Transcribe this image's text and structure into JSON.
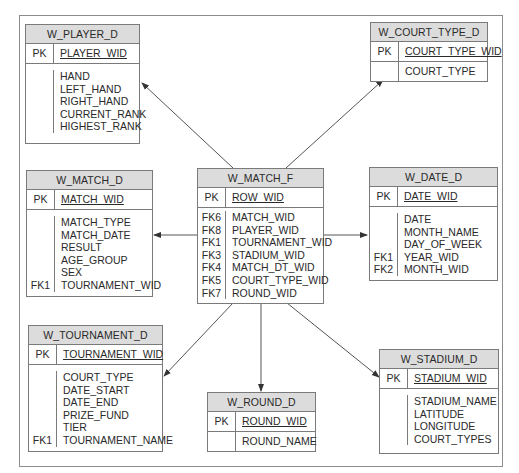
{
  "diagram": {
    "type": "star-schema",
    "fact_table": "W_MATCH_F",
    "tables": {
      "player_d": {
        "name": "W_PLAYER_D",
        "pk_label": "PK",
        "pk": "PLAYER_WID",
        "fields": [
          {
            "key": "",
            "name": "HAND"
          },
          {
            "key": "",
            "name": "LEFT_HAND"
          },
          {
            "key": "",
            "name": "RIGHT_HAND"
          },
          {
            "key": "",
            "name": "CURRENT_RANK"
          },
          {
            "key": "",
            "name": "HIGHEST_RANK"
          }
        ]
      },
      "court_type_d": {
        "name": "W_COURT_TYPE_D",
        "pk_label": "PK",
        "pk": "COURT_TYPE_WID",
        "fields": [
          {
            "key": "",
            "name": "COURT_TYPE"
          }
        ]
      },
      "match_d": {
        "name": "W_MATCH_D",
        "pk_label": "PK",
        "pk": "MATCH_WID",
        "fields": [
          {
            "key": "",
            "name": "MATCH_TYPE"
          },
          {
            "key": "",
            "name": "MATCH_DATE"
          },
          {
            "key": "",
            "name": "RESULT"
          },
          {
            "key": "",
            "name": "AGE_GROUP"
          },
          {
            "key": "",
            "name": "SEX"
          },
          {
            "key": "FK1",
            "name": "TOURNAMENT_WID"
          }
        ]
      },
      "match_f": {
        "name": "W_MATCH_F",
        "pk_label": "PK",
        "pk": "ROW_WID",
        "fields": [
          {
            "key": "FK6",
            "name": "MATCH_WID"
          },
          {
            "key": "FK8",
            "name": "PLAYER_WID"
          },
          {
            "key": "FK1",
            "name": "TOURNAMENT_WID"
          },
          {
            "key": "FK3",
            "name": "STADIUM_WID"
          },
          {
            "key": "FK4",
            "name": "MATCH_DT_WID"
          },
          {
            "key": "FK5",
            "name": "COURT_TYPE_WID"
          },
          {
            "key": "FK7",
            "name": "ROUND_WID"
          }
        ]
      },
      "date_d": {
        "name": "W_DATE_D",
        "pk_label": "PK",
        "pk": "DATE_WID",
        "fields": [
          {
            "key": "",
            "name": "DATE"
          },
          {
            "key": "",
            "name": "MONTH_NAME"
          },
          {
            "key": "",
            "name": "DAY_OF_WEEK"
          },
          {
            "key": "FK1",
            "name": "YEAR_WID"
          },
          {
            "key": "FK2",
            "name": "MONTH_WID"
          }
        ]
      },
      "tournament_d": {
        "name": "W_TOURNAMENT_D",
        "pk_label": "PK",
        "pk": "TOURNAMENT_WID",
        "fields": [
          {
            "key": "",
            "name": "COURT_TYPE"
          },
          {
            "key": "",
            "name": "DATE_START"
          },
          {
            "key": "",
            "name": "DATE_END"
          },
          {
            "key": "",
            "name": "PRIZE_FUND"
          },
          {
            "key": "",
            "name": "TIER"
          },
          {
            "key": "FK1",
            "name": "TOURNAMENT_NAME"
          }
        ]
      },
      "round_d": {
        "name": "W_ROUND_D",
        "pk_label": "PK",
        "pk": "ROUND_WID",
        "fields": [
          {
            "key": "",
            "name": "ROUND_NAME"
          }
        ]
      },
      "stadium_d": {
        "name": "W_STADIUM_D",
        "pk_label": "PK",
        "pk": "STADIUM_WID",
        "fields": [
          {
            "key": "",
            "name": "STADIUM_NAME"
          },
          {
            "key": "",
            "name": "LATITUDE"
          },
          {
            "key": "",
            "name": "LONGITUDE"
          },
          {
            "key": "",
            "name": "COURT_TYPES"
          }
        ]
      }
    },
    "relationships": [
      {
        "from": "W_MATCH_F",
        "to": "W_PLAYER_D"
      },
      {
        "from": "W_MATCH_F",
        "to": "W_COURT_TYPE_D"
      },
      {
        "from": "W_MATCH_F",
        "to": "W_MATCH_D"
      },
      {
        "from": "W_MATCH_F",
        "to": "W_DATE_D"
      },
      {
        "from": "W_MATCH_F",
        "to": "W_TOURNAMENT_D"
      },
      {
        "from": "W_MATCH_F",
        "to": "W_ROUND_D"
      },
      {
        "from": "W_MATCH_F",
        "to": "W_STADIUM_D"
      }
    ],
    "colors": {
      "header_fill": "#dcdcdc",
      "border": "#7a7a7a",
      "frame": "#8c8c8c",
      "arrow": "#555555"
    }
  }
}
